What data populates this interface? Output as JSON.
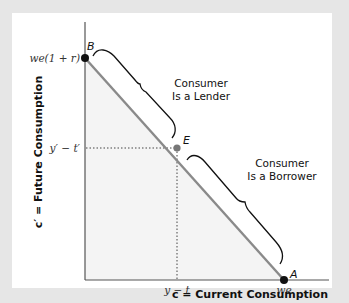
{
  "figure": {
    "y_axis_title": "c′ = Future Consumption",
    "x_axis_title": "c = Current Consumption",
    "y_ticks": {
      "top": "we(1 + r)",
      "mid": "y′ − t′"
    },
    "x_ticks": {
      "mid": "y − t",
      "right": "we"
    },
    "points": {
      "B": "B",
      "E": "E",
      "A": "A"
    },
    "annotations": {
      "lender_line1": "Consumer",
      "lender_line2": "Is a Lender",
      "borrower_line1": "Consumer",
      "borrower_line2": "Is a Borrower"
    },
    "colors": {
      "budget_line": "#8a8a8a",
      "axis": "#555555",
      "shade": "#f4f4f4",
      "frame": "#e6e6e6",
      "point": "#111111",
      "point_E": "#777777"
    }
  }
}
